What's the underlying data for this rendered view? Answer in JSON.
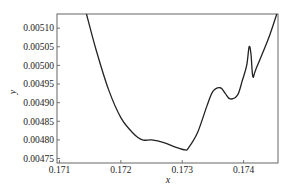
{
  "chart_data": {
    "type": "line",
    "title": "",
    "xlabel": "x",
    "ylabel": "y",
    "xlim": [
      0.17096,
      0.17456
    ],
    "ylim": [
      0.004738,
      0.005138
    ],
    "grid": false,
    "legend": null,
    "xticks": [
      0.171,
      0.172,
      0.173,
      0.174
    ],
    "xtick_labels": [
      "0.171",
      "0.172",
      "0.173",
      "0.174"
    ],
    "yticks": [
      0.00475,
      0.0048,
      0.00485,
      0.0049,
      0.00495,
      0.005,
      0.00505,
      0.0051
    ],
    "ytick_labels": [
      "0.00475",
      "0.00480",
      "0.00485",
      "0.00490",
      "0.00495",
      "0.00500",
      "0.00505",
      "0.00510"
    ],
    "series": [
      {
        "name": "y(x)",
        "color": "#222222",
        "x": [
          0.17144,
          0.1716,
          0.1718,
          0.172,
          0.1722,
          0.17235,
          0.1725,
          0.1727,
          0.1729,
          0.17305,
          0.1731,
          0.17325,
          0.1734,
          0.1735,
          0.17362,
          0.1737,
          0.17378,
          0.1739,
          0.17398,
          0.17405,
          0.17409,
          0.17412,
          0.17415,
          0.1742,
          0.1744,
          0.17454
        ],
        "y": [
          0.005138,
          0.00504,
          0.004935,
          0.00486,
          0.004818,
          0.0048,
          0.0048,
          0.004793,
          0.00478,
          0.004773,
          0.004778,
          0.00482,
          0.00489,
          0.00493,
          0.00494,
          0.004925,
          0.00491,
          0.00492,
          0.00496,
          0.005,
          0.00505,
          0.00503,
          0.00497,
          0.00499,
          0.00507,
          0.005138
        ]
      }
    ]
  }
}
